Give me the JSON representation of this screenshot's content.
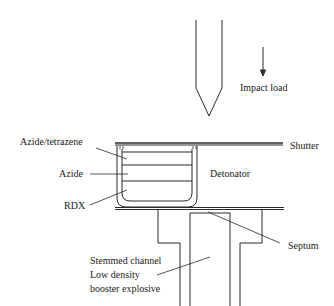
{
  "diagram": {
    "type": "cross-section schematic",
    "colors": {
      "line": "#2a2a2a",
      "text": "#1a1a1a",
      "background": "#ffffff"
    }
  },
  "labels": {
    "impact_load": "Impact load",
    "shutter": "Shutter",
    "azide_tetrazene": "Azide/tetrazene",
    "azide": "Azide",
    "rdx": "RDX",
    "detonator": "Detonator",
    "septum": "Septum",
    "stemmed_channel": [
      "Stemmed channel",
      "Low density",
      "booster explosive"
    ]
  },
  "components": [
    {
      "name": "striker",
      "description": "Pointed firing pin above the shutter"
    },
    {
      "name": "impact-arrow",
      "description": "Downward arrow indicating impact load"
    },
    {
      "name": "shutter",
      "description": "Horizontal plate between striker and detonator"
    },
    {
      "name": "detonator-cup",
      "description": "Cup containing three layered charges",
      "layers": [
        "Azide/tetrazene",
        "Azide",
        "RDX"
      ]
    },
    {
      "name": "septum",
      "description": "Thin plate under detonator"
    },
    {
      "name": "booster-housing",
      "description": "Stepped housing with stemmed channel of low density booster explosive"
    }
  ]
}
